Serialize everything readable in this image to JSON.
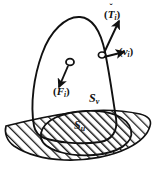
{
  "figure": {
    "kind": "mechanics-free-body-diagram",
    "background_color": "#ffffff",
    "ink_color": "#111111",
    "hatch_color": "#1a1a1a"
  },
  "labels": {
    "traction": {
      "open_paren": "(",
      "symbol": "T",
      "subscript": "i",
      "close_paren": ")",
      "vector_mark": "ˇ",
      "name": "traction-vector"
    },
    "velocity": {
      "open_paren": "(",
      "symbol": "v",
      "subscript": "i",
      "close_paren": ")",
      "vector_mark": "",
      "name": "velocity-vector"
    },
    "body_force": {
      "open_paren": "(",
      "symbol": "F",
      "subscript": "i",
      "close_paren": ")",
      "vector_mark": "",
      "name": "body-force-vector"
    },
    "surface_v": {
      "symbol": "S",
      "subscript": "v",
      "name": "velocity-boundary-surface"
    },
    "surface_u": {
      "symbol": "S",
      "subscript": "u",
      "name": "displacement-boundary-surface"
    }
  },
  "geometry": {
    "body_outline": "M 34 126 C 30 104 34 76 42 54 C 50 31 66 16 80 17 C 93 18 101 33 105 52 C 110 76 113 100 116 118 C 118 131 112 140 100 142 C 78 145 56 142 44 138 C 37 135 35 131 34 126 Z",
    "ground_polygon": "M 6 126 C 30 120 54 115 76 112 C 100 109 122 110 140 114 C 148 116 152 120 150 126 C 148 134 140 142 128 148 C 112 156 88 161 64 160 C 44 159 26 154 14 146 C 7 141 4 133 6 126 Z",
    "contact_ellipse": "M 41 133 C 44 120 62 112 86 111 C 110 110 128 117 131 130 C 134 143 118 153 94 155 C 68 157 44 150 41 138 Z",
    "arrows": [
      {
        "name": "traction-arrow",
        "x1": 104,
        "y1": 54,
        "x2": 118,
        "y2": 22
      },
      {
        "name": "velocity-arrow",
        "x1": 103,
        "y1": 56,
        "x2": 123,
        "y2": 52
      },
      {
        "name": "force-arrow",
        "x1": 69,
        "y1": 66,
        "x2": 59,
        "y2": 88
      }
    ],
    "surface_point": {
      "name": "surface-point-marker",
      "cx": 102,
      "cy": 55,
      "r": 3.2
    },
    "interior_point": {
      "name": "interior-point-marker",
      "cx": 70,
      "cy": 63,
      "r": 3.4
    }
  }
}
